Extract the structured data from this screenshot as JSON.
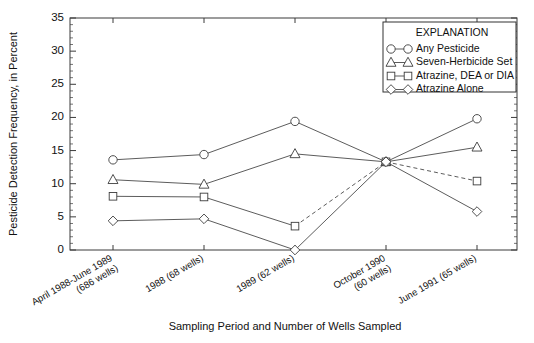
{
  "chart_data": {
    "type": "line",
    "title": "",
    "xlabel": "Sampling Period and Number of Wells Sampled",
    "ylabel": "Pesticide Detection Frequency, in Percent",
    "ylim": [
      0,
      35
    ],
    "ytick_values": [
      0,
      5,
      10,
      15,
      20,
      25,
      30,
      35
    ],
    "ytick_labels": [
      "0",
      "5",
      "10",
      "15",
      "20",
      "25",
      "30",
      "35"
    ],
    "grid": false,
    "legend_position": "top-right",
    "legend_title": "EXPLANATION",
    "categories": [
      "April 1988-June 1989\n(686 wells)",
      "1988 (68 wells)",
      "1989 (62 wells)",
      "October 1990\n(60 wells)",
      "June 1991 (65 wells)"
    ],
    "category_lines": [
      [
        "April 1988-June 1989",
        "(686 wells)"
      ],
      [
        "1988 (68 wells)"
      ],
      [
        "1989 (62 wells)"
      ],
      [
        "October 1990",
        "(60 wells)"
      ],
      [
        "June 1991 (65 wells)"
      ]
    ],
    "series": [
      {
        "name": "Any Pesticide",
        "marker": "circle",
        "linestyle": "solid",
        "values": [
          13.6,
          14.4,
          19.4,
          13.3,
          19.8
        ]
      },
      {
        "name": "Seven-Herbicide Set",
        "marker": "triangle",
        "linestyle": "solid",
        "values": [
          10.6,
          9.9,
          14.5,
          13.3,
          15.5
        ]
      },
      {
        "name": "Atrazine, DEA or DIA",
        "marker": "square",
        "linestyle": "solid-then-dashed",
        "dashed_from_index": 2,
        "values": [
          8.1,
          8.0,
          3.6,
          13.3,
          10.4
        ]
      },
      {
        "name": "Atrazine Alone",
        "marker": "diamond",
        "linestyle": "solid",
        "values": [
          4.4,
          4.7,
          0.0,
          13.3,
          5.8
        ]
      }
    ]
  },
  "axes": {
    "ylabel": "Pesticide Detection Frequency, in Percent",
    "xlabel": "Sampling Period and Number of Wells Sampled"
  },
  "legend": {
    "title": "EXPLANATION",
    "entries": [
      {
        "label": "Any Pesticide",
        "marker": "circle"
      },
      {
        "label": "Seven-Herbicide Set",
        "marker": "triangle"
      },
      {
        "label": "Atrazine, DEA or DIA",
        "marker": "square"
      },
      {
        "label": "Atrazine Alone",
        "marker": "diamond"
      }
    ]
  },
  "colors": {
    "line": "#4a4a4a",
    "axis": "#3a3a3a",
    "text": "#111111",
    "marker_fill": "#ffffff"
  }
}
